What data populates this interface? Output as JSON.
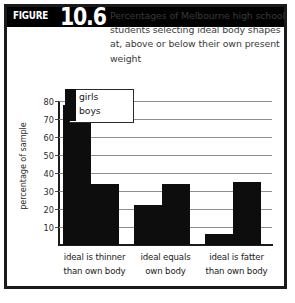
{
  "figure": {
    "tag": "FIGURE",
    "number": "10.6",
    "title_lines": [
      "Percentages of Melbourne high school",
      "students selecting ideal body shapes",
      "at, above or below their own present",
      "weight"
    ]
  },
  "chart_data": {
    "type": "bar",
    "title": "Percentages of Melbourne high school students selecting ideal body shapes at, above or below their own present weight",
    "xlabel": "",
    "ylabel": "percentage of sample",
    "categories": [
      "ideal is thinner than own body",
      "ideal equals own body",
      "ideal is fatter than own body"
    ],
    "category_lines": [
      [
        "ideal is thinner",
        "than own body"
      ],
      [
        "ideal equals",
        "own body"
      ],
      [
        "ideal is fatter",
        "than own body"
      ]
    ],
    "series": [
      {
        "name": "girls",
        "values": [
          78,
          22,
          6
        ],
        "color": "#0d0d0d"
      },
      {
        "name": "boys",
        "values": [
          34,
          34,
          35
        ],
        "color": "#0d0d0d"
      }
    ],
    "ylim": [
      0,
      80
    ],
    "yticks": [
      10,
      20,
      30,
      40,
      50,
      60,
      70,
      80
    ],
    "ytick_labels": [
      "10",
      "20",
      "30",
      "40",
      "50",
      "60",
      "70",
      "80"
    ],
    "grid": true,
    "legend_position": "top-left",
    "legend_entries": [
      "girls",
      "boys"
    ]
  },
  "colors": {
    "bar": "#0d0d0d",
    "frame": "#1a1a1a",
    "band": "#000000",
    "grid": "#8d8d8d",
    "title_text": "#3a3a3a"
  }
}
